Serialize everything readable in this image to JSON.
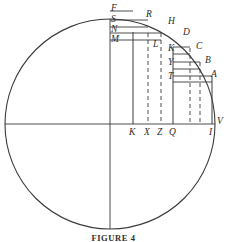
{
  "figure": {
    "caption": "FIGURE 4",
    "type": "geometric-diagram",
    "colors": {
      "stroke": "#3a3a3a",
      "label": "#2b2b2b",
      "background": "#ffffff"
    },
    "circle": {
      "center_x": 110,
      "center_y": 124,
      "radius": 105
    },
    "axes": {
      "vertical": {
        "x": 110,
        "y1": 19,
        "y2": 229
      },
      "horizontal": {
        "y": 124,
        "x1": 5,
        "x2": 215
      }
    },
    "upper_labels": [
      {
        "id": "F",
        "text": "F",
        "x": 111,
        "y": 4
      },
      {
        "id": "S",
        "text": "S",
        "x": 111,
        "y": 15
      },
      {
        "id": "N",
        "text": "N",
        "x": 111,
        "y": 25
      },
      {
        "id": "M",
        "text": "M",
        "x": 111,
        "y": 35
      },
      {
        "id": "R",
        "text": "R",
        "x": 146,
        "y": 10
      },
      {
        "id": "H",
        "text": "H",
        "x": 168,
        "y": 17
      },
      {
        "id": "L",
        "text": "L",
        "x": 153,
        "y": 40
      },
      {
        "id": "D",
        "text": "D",
        "x": 183,
        "y": 28
      },
      {
        "id": "K2",
        "text": "K",
        "x": 168,
        "y": 44
      },
      {
        "id": "C",
        "text": "C",
        "x": 196,
        "y": 42
      },
      {
        "id": "Y",
        "text": "Y",
        "x": 168,
        "y": 58
      },
      {
        "id": "B",
        "text": "B",
        "x": 205,
        "y": 56
      },
      {
        "id": "T",
        "text": "T",
        "x": 168,
        "y": 72
      },
      {
        "id": "A",
        "text": "A",
        "x": 211,
        "y": 70
      }
    ],
    "baseline_labels": [
      {
        "id": "K",
        "text": "K",
        "x": 129,
        "y": 128
      },
      {
        "id": "X",
        "text": "X",
        "x": 144,
        "y": 128
      },
      {
        "id": "Z",
        "text": "Z",
        "x": 157,
        "y": 128
      },
      {
        "id": "Q",
        "text": "Q",
        "x": 169,
        "y": 128
      },
      {
        "id": "I",
        "text": "I",
        "x": 209,
        "y": 128
      },
      {
        "id": "V",
        "text": "V",
        "x": 217,
        "y": 117
      }
    ],
    "verticals": [
      {
        "id": "K",
        "x": 133,
        "top": 32,
        "style": "solid"
      },
      {
        "id": "X",
        "x": 148,
        "top": 33,
        "style": "dashed"
      },
      {
        "id": "Z",
        "x": 161,
        "top": 33,
        "style": "dashed"
      },
      {
        "id": "Q",
        "x": 173,
        "top": 47,
        "style": "solid"
      },
      {
        "id": "C-drop",
        "x": 190,
        "top": 48,
        "style": "dashed"
      },
      {
        "id": "B-drop",
        "x": 200,
        "top": 62,
        "style": "dashed"
      },
      {
        "id": "I",
        "x": 212,
        "top": 76,
        "style": "solid"
      }
    ],
    "horizontals": [
      {
        "id": "F-top",
        "y": 11,
        "x1": 110,
        "x2": 133
      },
      {
        "id": "S-R",
        "y": 20,
        "x1": 110,
        "x2": 148
      },
      {
        "id": "N-top",
        "y": 27,
        "x1": 110,
        "x2": 148
      },
      {
        "id": "M-H",
        "y": 33,
        "x1": 110,
        "x2": 161
      },
      {
        "id": "M-base",
        "y": 40,
        "x1": 110,
        "x2": 161
      },
      {
        "id": "D-K",
        "y": 47,
        "x1": 173,
        "x2": 190
      },
      {
        "id": "K-C",
        "y": 54,
        "x1": 173,
        "x2": 190
      },
      {
        "id": "Y-B",
        "y": 62,
        "x1": 173,
        "x2": 200
      },
      {
        "id": "Y-base",
        "y": 69,
        "x1": 173,
        "x2": 200
      },
      {
        "id": "T-A",
        "y": 76,
        "x1": 173,
        "x2": 212
      },
      {
        "id": "T-base",
        "y": 82,
        "x1": 173,
        "x2": 212
      }
    ]
  }
}
